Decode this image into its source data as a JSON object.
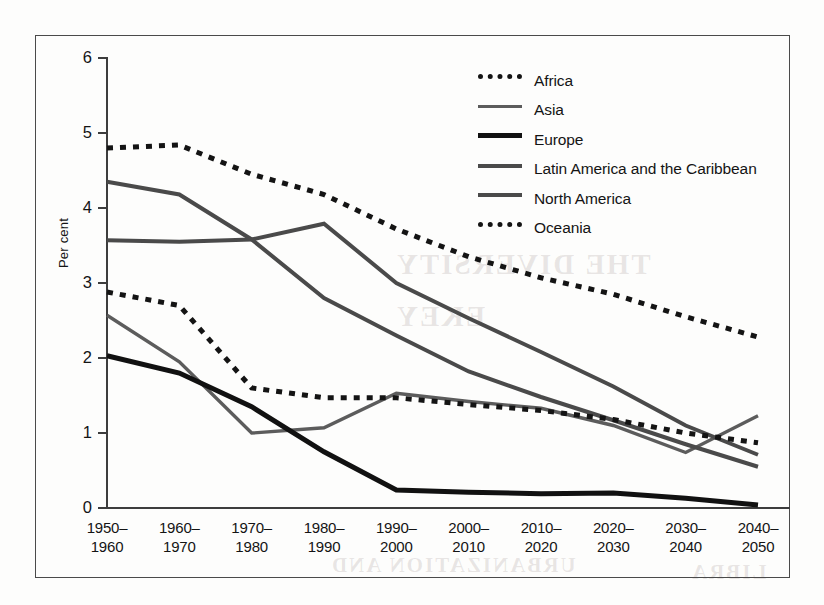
{
  "chart_data": {
    "type": "line",
    "title": "",
    "xlabel": "",
    "ylabel": "Per cent",
    "ylim": [
      0,
      6
    ],
    "yticks": [
      0,
      1,
      2,
      3,
      4,
      5,
      6
    ],
    "ytick_labels": [
      "0",
      "1",
      "2",
      "3",
      "4",
      "5",
      "6"
    ],
    "grid": false,
    "legend_position": "top-right",
    "categories": [
      "1950–\n1960",
      "1960–\n1970",
      "1970–\n1980",
      "1980–\n1990",
      "1990–\n2000",
      "2000–\n2010",
      "2010–\n2020",
      "2020–\n2030",
      "2030–\n2040",
      "2040–\n2050"
    ],
    "category_lines": [
      [
        "1950–",
        "1960"
      ],
      [
        "1960–",
        "1970"
      ],
      [
        "1970–",
        "1980"
      ],
      [
        "1980–",
        "1990"
      ],
      [
        "1990–",
        "2000"
      ],
      [
        "2000–",
        "2010"
      ],
      [
        "2010–",
        "2020"
      ],
      [
        "2020–",
        "2030"
      ],
      [
        "2030–",
        "2040"
      ],
      [
        "2040–",
        "2050"
      ]
    ],
    "series": [
      {
        "name": "Africa",
        "style": "dotted",
        "color": "#141414",
        "width": 5,
        "values": [
          4.8,
          4.84,
          4.45,
          4.18,
          3.72,
          3.35,
          3.07,
          2.85,
          2.55,
          2.28
        ]
      },
      {
        "name": "Asia",
        "style": "solid",
        "color": "#5c5c5c",
        "width": 3.4,
        "values": [
          2.57,
          1.95,
          1.0,
          1.07,
          1.53,
          1.42,
          1.33,
          1.1,
          0.74,
          1.23
        ]
      },
      {
        "name": "Europe",
        "style": "solid",
        "color": "#111111",
        "width": 5,
        "values": [
          2.03,
          1.8,
          1.35,
          0.75,
          0.24,
          0.21,
          0.19,
          0.2,
          0.13,
          0.04
        ]
      },
      {
        "name": "Latin America and the Caribbean",
        "style": "solid",
        "color": "#4a4a4a",
        "width": 4,
        "values": [
          4.35,
          4.18,
          3.58,
          2.8,
          2.3,
          1.82,
          1.48,
          1.17,
          0.85,
          0.55
        ]
      },
      {
        "name": "North America",
        "style": "solid",
        "color": "#4a4a4a",
        "width": 4,
        "values": [
          3.57,
          3.55,
          3.58,
          3.79,
          3.0,
          2.53,
          2.08,
          1.62,
          1.1,
          0.71
        ]
      },
      {
        "name": "Oceania",
        "style": "dotted",
        "color": "#141414",
        "width": 5,
        "values": [
          2.88,
          2.7,
          1.6,
          1.47,
          1.47,
          1.38,
          1.3,
          1.18,
          1.0,
          0.87
        ]
      }
    ]
  },
  "axis": {
    "y_title": "Per cent"
  },
  "legend": {
    "items": [
      {
        "label": "Africa",
        "swatch": "dotted"
      },
      {
        "label": "Asia",
        "swatch": "solid-thin"
      },
      {
        "label": "Europe",
        "swatch": "solid-thick"
      },
      {
        "label": "Latin America and the Caribbean",
        "swatch": "solid-med"
      },
      {
        "label": "North America",
        "swatch": "solid-med"
      },
      {
        "label": "Oceania",
        "swatch": "dotted"
      }
    ]
  },
  "bleed_text": {
    "line1": "THE DIVERSITY",
    "line2": "EKEY",
    "line3": "URBANIZATION AND",
    "line4": "LIBRA"
  }
}
